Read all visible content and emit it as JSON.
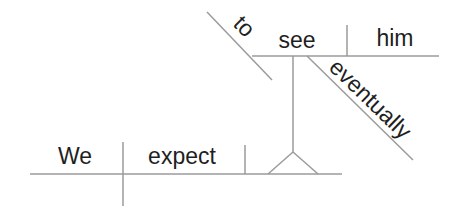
{
  "diagram": {
    "type": "reed-kellogg-sentence-diagram",
    "sentence": "We expect to see him eventually",
    "main_clause": {
      "subject": "We",
      "verb": "expect"
    },
    "infinitive_phrase": {
      "particle": "to",
      "verb": "see",
      "object": "him",
      "adverb": "eventually"
    },
    "colors": {
      "line": "#9b9b9b",
      "text": "#1f1f1f",
      "background": "#ffffff"
    }
  }
}
